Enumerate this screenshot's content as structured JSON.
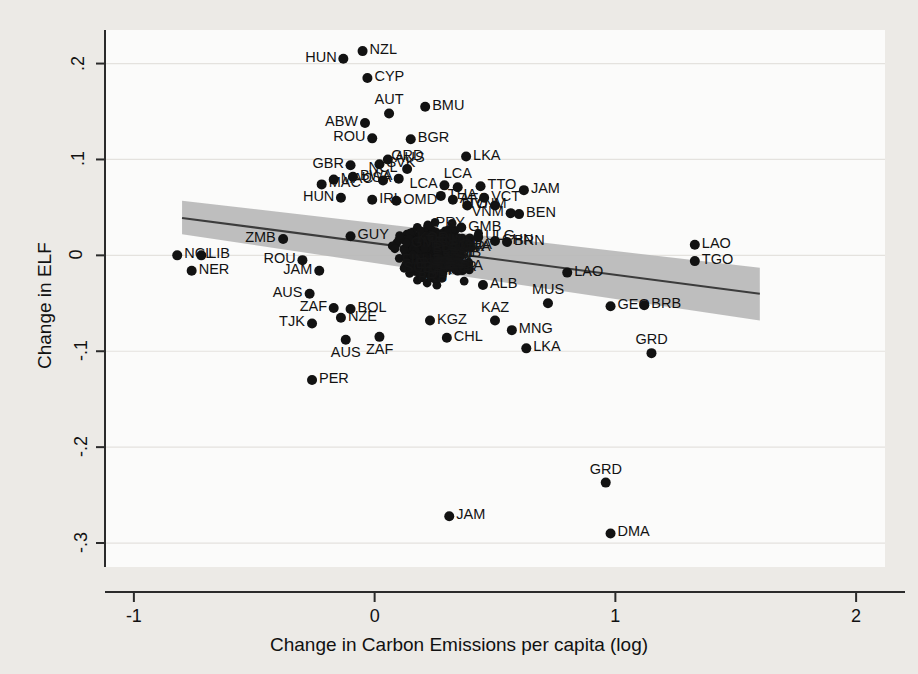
{
  "chart_data": {
    "type": "scatter",
    "title": "",
    "xlabel": "Change in Carbon Emissions per capita (log)",
    "ylabel": "Change in ELF",
    "xlim": [
      -1.12,
      2.12
    ],
    "ylim": [
      -0.325,
      0.235
    ],
    "xticks": [
      "-1",
      "0",
      "1",
      "2"
    ],
    "xtick_values": [
      -1,
      0,
      1,
      2
    ],
    "yticks": [
      ".2",
      ".1",
      "0",
      "-.1",
      "-.2",
      "-.3"
    ],
    "ytick_values": [
      0.2,
      0.1,
      0,
      -0.1,
      -0.2,
      -0.3
    ],
    "grid": true,
    "legend": "none",
    "marker_color": "#121212",
    "fit_line_color": "#3a3a3a",
    "ci_band_color": "#b9b9b9",
    "background_color": "#eceae6",
    "plot_background_color": "#fbfbfa",
    "fit_line": {
      "x_start": -0.8,
      "y_start": 0.039,
      "x_end": 1.6,
      "y_end": -0.04
    },
    "ci_band": {
      "x_start": -0.8,
      "upper_start": 0.057,
      "lower_start": 0.022,
      "x_end": 1.6,
      "upper_end": -0.013,
      "lower_end": -0.068
    },
    "points": [
      {
        "label": "NZL",
        "x": -0.05,
        "y": 0.213,
        "lp": "right"
      },
      {
        "label": "HUN",
        "x": -0.13,
        "y": 0.205,
        "lp": "left"
      },
      {
        "label": "CYP",
        "x": -0.03,
        "y": 0.185,
        "lp": "right"
      },
      {
        "label": "AUT",
        "x": 0.06,
        "y": 0.148,
        "lp": "above"
      },
      {
        "label": "BMU",
        "x": 0.21,
        "y": 0.155,
        "lp": "right"
      },
      {
        "label": "ABW",
        "x": -0.04,
        "y": 0.138,
        "lp": "left"
      },
      {
        "label": "BGR",
        "x": 0.15,
        "y": 0.121,
        "lp": "right"
      },
      {
        "label": "ROU",
        "x": -0.01,
        "y": 0.122,
        "lp": "left"
      },
      {
        "label": "LKA",
        "x": 0.38,
        "y": 0.103,
        "lp": "right"
      },
      {
        "label": "GBR",
        "x": -0.1,
        "y": 0.094,
        "lp": "left"
      },
      {
        "label": "SVK",
        "x": 0.02,
        "y": 0.095,
        "lp": "right"
      },
      {
        "label": "AUS",
        "x": 0.055,
        "y": 0.1,
        "lp": "right"
      },
      {
        "label": "GRD",
        "x": 0.135,
        "y": 0.09,
        "lp": "above"
      },
      {
        "label": "MAC",
        "x": -0.17,
        "y": 0.079,
        "lp": "right"
      },
      {
        "label": "BWA",
        "x": -0.09,
        "y": 0.082,
        "lp": "right"
      },
      {
        "label": "NCL",
        "x": 0.035,
        "y": 0.078,
        "lp": "above"
      },
      {
        "label": "USA",
        "x": 0.1,
        "y": 0.08,
        "lp": "left"
      },
      {
        "label": "MAC",
        "x": -0.22,
        "y": 0.074,
        "lp": "right"
      },
      {
        "label": "LCA",
        "x": 0.29,
        "y": 0.073,
        "lp": "left"
      },
      {
        "label": "LCA",
        "x": 0.345,
        "y": 0.071,
        "lp": "above"
      },
      {
        "label": "TTO",
        "x": 0.44,
        "y": 0.072,
        "lp": "right"
      },
      {
        "label": "JAM",
        "x": 0.62,
        "y": 0.068,
        "lp": "right"
      },
      {
        "label": "HUN",
        "x": -0.14,
        "y": 0.06,
        "lp": "left"
      },
      {
        "label": "IRL",
        "x": -0.01,
        "y": 0.058,
        "lp": "right"
      },
      {
        "label": "OMD",
        "x": 0.09,
        "y": 0.057,
        "lp": "right"
      },
      {
        "label": "THA",
        "x": 0.275,
        "y": 0.062,
        "lp": "right"
      },
      {
        "label": "AFA",
        "x": 0.325,
        "y": 0.058,
        "lp": "right"
      },
      {
        "label": "VCT",
        "x": 0.455,
        "y": 0.06,
        "lp": "right"
      },
      {
        "label": "VNM",
        "x": 0.385,
        "y": 0.052,
        "lp": "right"
      },
      {
        "label": "TTO",
        "x": 0.5,
        "y": 0.052,
        "lp": "left"
      },
      {
        "label": "VNM",
        "x": 0.565,
        "y": 0.044,
        "lp": "left"
      },
      {
        "label": "BEN",
        "x": 0.6,
        "y": 0.043,
        "lp": "right"
      },
      {
        "label": "GUY",
        "x": -0.1,
        "y": 0.02,
        "lp": "right"
      },
      {
        "label": "ZMB",
        "x": -0.38,
        "y": 0.017,
        "lp": "left"
      },
      {
        "label": "GMB",
        "x": 0.36,
        "y": 0.029,
        "lp": "right"
      },
      {
        "label": "ULG",
        "x": 0.43,
        "y": 0.019,
        "lp": "right"
      },
      {
        "label": "CHN",
        "x": 0.5,
        "y": 0.015,
        "lp": "right"
      },
      {
        "label": "BRN",
        "x": 0.55,
        "y": 0.014,
        "lp": "right"
      },
      {
        "label": "LAO",
        "x": 1.33,
        "y": 0.011,
        "lp": "right"
      },
      {
        "label": "TGO",
        "x": 1.33,
        "y": -0.006,
        "lp": "right"
      },
      {
        "label": "NCL",
        "x": -0.82,
        "y": 0.0,
        "lp": "right"
      },
      {
        "label": "LIB",
        "x": -0.72,
        "y": 0.0,
        "lp": "right"
      },
      {
        "label": "NER",
        "x": -0.76,
        "y": -0.016,
        "lp": "right"
      },
      {
        "label": "ROU",
        "x": -0.3,
        "y": -0.005,
        "lp": "left"
      },
      {
        "label": "JAM",
        "x": -0.23,
        "y": -0.016,
        "lp": "left"
      },
      {
        "label": "LAO",
        "x": 0.8,
        "y": -0.018,
        "lp": "right"
      },
      {
        "label": "ALB",
        "x": 0.45,
        "y": -0.031,
        "lp": "right"
      },
      {
        "label": "AUS",
        "x": -0.27,
        "y": -0.04,
        "lp": "left"
      },
      {
        "label": "MUS",
        "x": 0.72,
        "y": -0.05,
        "lp": "above"
      },
      {
        "label": "GEO",
        "x": 0.98,
        "y": -0.053,
        "lp": "right"
      },
      {
        "label": "BRB",
        "x": 1.12,
        "y": -0.052,
        "lp": "right"
      },
      {
        "label": "ZAF",
        "x": -0.17,
        "y": -0.055,
        "lp": "left"
      },
      {
        "label": "BOL",
        "x": -0.1,
        "y": -0.056,
        "lp": "right"
      },
      {
        "label": "NZE",
        "x": -0.14,
        "y": -0.065,
        "lp": "right"
      },
      {
        "label": "TJK",
        "x": -0.26,
        "y": -0.071,
        "lp": "left"
      },
      {
        "label": "KGZ",
        "x": 0.23,
        "y": -0.068,
        "lp": "right"
      },
      {
        "label": "KAZ",
        "x": 0.5,
        "y": -0.068,
        "lp": "above"
      },
      {
        "label": "MNG",
        "x": 0.57,
        "y": -0.078,
        "lp": "right"
      },
      {
        "label": "AUS",
        "x": -0.12,
        "y": -0.088,
        "lp": "below"
      },
      {
        "label": "ZAF",
        "x": 0.02,
        "y": -0.085,
        "lp": "below"
      },
      {
        "label": "CHL",
        "x": 0.3,
        "y": -0.086,
        "lp": "right"
      },
      {
        "label": "LKA",
        "x": 0.63,
        "y": -0.097,
        "lp": "right"
      },
      {
        "label": "GRD",
        "x": 1.15,
        "y": -0.102,
        "lp": "above"
      },
      {
        "label": "PER",
        "x": -0.26,
        "y": -0.13,
        "lp": "right"
      },
      {
        "label": "GRD",
        "x": 0.96,
        "y": -0.237,
        "lp": "above"
      },
      {
        "label": "JAM",
        "x": 0.31,
        "y": -0.272,
        "lp": "right"
      },
      {
        "label": "DMA",
        "x": 0.98,
        "y": -0.29,
        "lp": "right"
      }
    ],
    "cluster_note": "dense overlapping core cluster near x in [0.0,0.55], y in [-0.05,0.05]",
    "cluster_labels": [
      "FIN",
      "LVA",
      "BIH",
      "TUN",
      "TUR",
      "GMB",
      "SUR",
      "PRY",
      "IMB",
      "BGD",
      "ECU",
      "SLV",
      "GHA",
      "IRN",
      "EST",
      "MDA",
      "LVA",
      "CMR",
      "NPL",
      "BRB",
      "ARG",
      "SWE",
      "NLD",
      "KOR",
      "ZWE",
      "SEN",
      "PHL",
      "MEX",
      "IND",
      "COL",
      "JOR",
      "BLZ",
      "CIV",
      "LBN",
      "MLI",
      "PAN",
      "DZA",
      "KEN"
    ]
  },
  "figure": {
    "caption": "",
    "source_note": ""
  }
}
